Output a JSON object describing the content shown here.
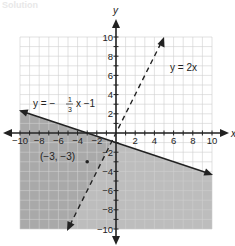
{
  "header": {
    "title": "Solution"
  },
  "axes": {
    "x_label": "x",
    "y_label": "y",
    "x_ticks": [
      "-10",
      "-8",
      "-6",
      "-4",
      "-2",
      "2",
      "4",
      "6",
      "8",
      "10"
    ],
    "y_ticks": [
      "10",
      "8",
      "6",
      "4",
      "2",
      "-2",
      "-4",
      "-6",
      "-8",
      "-10"
    ]
  },
  "lines": {
    "line1": {
      "label_lhs": "y = −",
      "frac_num": "1",
      "frac_den": "3",
      "label_rhs": "x −1",
      "style": "solid"
    },
    "line2": {
      "label": "y = 2x",
      "style": "dashed"
    }
  },
  "point": {
    "label": "(−3, −3)",
    "x": -3,
    "y": -3
  },
  "colors": {
    "shade": "#b3b3b3",
    "shade_dark": "#9a9a9a",
    "grid": "#cfcfcf",
    "axis": "#222222"
  },
  "chart_data": {
    "type": "line",
    "title": "",
    "xlabel": "x",
    "ylabel": "y",
    "xlim": [
      -10,
      10
    ],
    "ylim": [
      -10,
      10
    ],
    "grid": true,
    "series": [
      {
        "name": "y = -1/3 x - 1",
        "style": "solid",
        "slope": -0.3333,
        "intercept": -1,
        "x": [
          -10,
          10
        ],
        "y": [
          2.33,
          -4.33
        ],
        "shading": "below"
      },
      {
        "name": "y = 2x",
        "style": "dashed",
        "slope": 2,
        "intercept": 0,
        "x": [
          -5,
          5
        ],
        "y": [
          -10,
          10
        ],
        "shading": "left/above (x side)"
      }
    ],
    "points": [
      {
        "label": "(-3, -3)",
        "x": -3,
        "y": -3
      }
    ],
    "annotations": [
      "y = -1/3 x - 1",
      "y = 2x",
      "(-3, -3)"
    ]
  }
}
